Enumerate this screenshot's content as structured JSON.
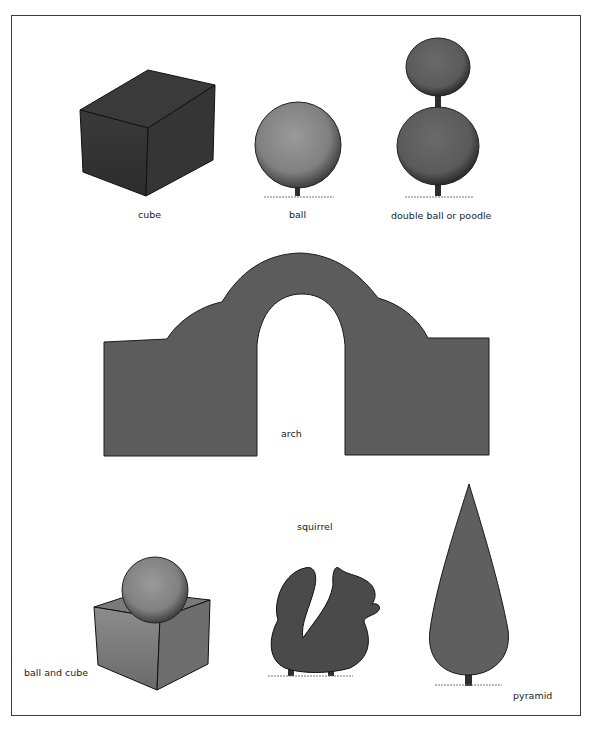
{
  "figure": {
    "shapes": [
      {
        "id": "cube",
        "label": "cube"
      },
      {
        "id": "ball",
        "label": "ball"
      },
      {
        "id": "double-ball",
        "label": "double ball or poodle"
      },
      {
        "id": "arch",
        "label": "arch"
      },
      {
        "id": "squirrel",
        "label": "squirrel"
      },
      {
        "id": "ball-and-cube",
        "label": "ball and cube"
      },
      {
        "id": "pyramid",
        "label": "pyramid"
      }
    ],
    "colors": {
      "hedge_dark": "#3d3d3d",
      "hedge_mid": "#5c5c5c",
      "hedge_light": "#8a8a8a",
      "outline": "#1a1a1a",
      "trunk": "#2e2e2e",
      "frame": "#3a3a3a"
    }
  }
}
